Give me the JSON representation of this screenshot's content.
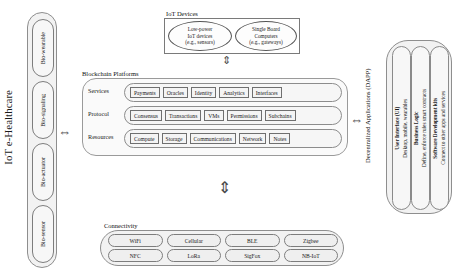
{
  "diagram": {
    "left_label": "IoT e-Healthcare",
    "healthcare_nodes": [
      {
        "label": "Bio-wearable"
      },
      {
        "label": "Bio-signaling"
      },
      {
        "label": "Bio-actuator"
      },
      {
        "label": "Bio-sensor"
      }
    ],
    "iot_devices": {
      "caption": "IoT Devices",
      "nodes": [
        {
          "line1": "Low-power",
          "line2": "IoT devices",
          "line3": "(e.g., sensors)"
        },
        {
          "line1": "Single Board",
          "line2": "Computers",
          "line3": "(e.g., gateways)"
        }
      ]
    },
    "blockchain": {
      "caption": "Blockchain Platforms",
      "rows": [
        {
          "label": "Services",
          "items": [
            "Payments",
            "Oracles",
            "Identity",
            "Analytics",
            "Interfaces"
          ]
        },
        {
          "label": "Protocol",
          "items": [
            "Consensus",
            "Transactions",
            "VMs",
            "Permissions",
            "Subchains"
          ]
        },
        {
          "label": "Resources",
          "items": [
            "Compute",
            "Storage",
            "Communications",
            "Network",
            "Notes"
          ]
        }
      ]
    },
    "dapp": {
      "caption": "Decentralized Applications (DAPP)",
      "items": [
        {
          "title": "User Interface (UI)",
          "subtitle": "Desktop, mobile, wearables"
        },
        {
          "title": "Business Logic",
          "subtitle": "Define, enforce rules smart contracts"
        },
        {
          "title": "Software Development kits",
          "subtitle": "Connect to other apps and services"
        }
      ]
    },
    "connectivity": {
      "caption": "Connectivity",
      "row1": [
        "WiFi",
        "Cellular",
        "BLE",
        "Zigbee"
      ],
      "row2": [
        "NFC",
        "LoRa",
        "SigFox",
        "NB-IoT"
      ]
    },
    "arrows": {
      "healthcare_to_iot": "⇔",
      "iot_to_blockchain": "⇕",
      "blockchain_to_connectivity": "⇕",
      "blockchain_to_dapp": "⇔"
    },
    "colors": {
      "background": "#ffffff",
      "outline": "#7d7d7d",
      "fill_light": "#f4f4f4",
      "fill_shell": "#f2f2f2",
      "text": "#1a1a1a"
    }
  }
}
